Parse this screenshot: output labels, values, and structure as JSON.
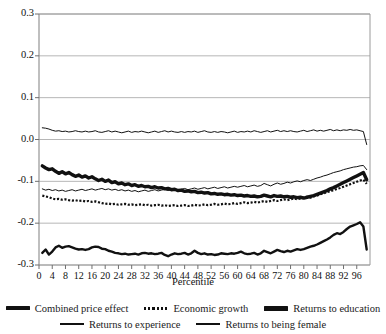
{
  "chart_data": {
    "type": "line",
    "title": "",
    "xlabel": "Percentile",
    "ylabel": "",
    "xlim": [
      0,
      100
    ],
    "ylim": [
      -0.3,
      0.3
    ],
    "yticks": [
      "0.3",
      "0.2",
      "0.1",
      "0.0",
      "-0.1",
      "-0.2",
      "-0.3"
    ],
    "ytick_values": [
      0.3,
      0.2,
      0.1,
      0.0,
      -0.1,
      -0.2,
      -0.3
    ],
    "xticks": [
      "0",
      "4",
      "8",
      "12",
      "16",
      "20",
      "24",
      "28",
      "32",
      "36",
      "40",
      "44",
      "48",
      "52",
      "56",
      "60",
      "64",
      "68",
      "72",
      "76",
      "80",
      "84",
      "88",
      "92",
      "96"
    ],
    "xtick_values": [
      0,
      4,
      8,
      12,
      16,
      20,
      24,
      28,
      32,
      36,
      40,
      44,
      48,
      52,
      56,
      60,
      64,
      68,
      72,
      76,
      80,
      84,
      88,
      92,
      96
    ],
    "grid": "horizontal",
    "legend_position": "bottom",
    "x": [
      1,
      2,
      3,
      4,
      5,
      6,
      7,
      8,
      9,
      10,
      11,
      12,
      13,
      14,
      15,
      16,
      17,
      18,
      19,
      20,
      21,
      22,
      23,
      24,
      25,
      26,
      27,
      28,
      29,
      30,
      31,
      32,
      33,
      34,
      35,
      36,
      37,
      38,
      39,
      40,
      41,
      42,
      43,
      44,
      45,
      46,
      47,
      48,
      49,
      50,
      51,
      52,
      53,
      54,
      55,
      56,
      57,
      58,
      59,
      60,
      61,
      62,
      63,
      64,
      65,
      66,
      67,
      68,
      69,
      70,
      71,
      72,
      73,
      74,
      75,
      76,
      77,
      78,
      79,
      80,
      81,
      82,
      83,
      84,
      85,
      86,
      87,
      88,
      89,
      90,
      91,
      92,
      93,
      94,
      95,
      96,
      97,
      98,
      99
    ],
    "series": [
      {
        "name": "Combined price effect",
        "style": "solid-thick",
        "color": "#111111",
        "values": [
          -0.271,
          -0.263,
          -0.275,
          -0.268,
          -0.258,
          -0.254,
          -0.259,
          -0.256,
          -0.255,
          -0.258,
          -0.261,
          -0.263,
          -0.262,
          -0.264,
          -0.262,
          -0.258,
          -0.256,
          -0.257,
          -0.261,
          -0.262,
          -0.266,
          -0.268,
          -0.271,
          -0.272,
          -0.274,
          -0.273,
          -0.275,
          -0.274,
          -0.273,
          -0.275,
          -0.272,
          -0.271,
          -0.273,
          -0.272,
          -0.274,
          -0.273,
          -0.271,
          -0.276,
          -0.279,
          -0.275,
          -0.272,
          -0.274,
          -0.273,
          -0.271,
          -0.275,
          -0.272,
          -0.266,
          -0.271,
          -0.274,
          -0.272,
          -0.275,
          -0.274,
          -0.276,
          -0.275,
          -0.272,
          -0.273,
          -0.274,
          -0.272,
          -0.273,
          -0.271,
          -0.268,
          -0.272,
          -0.274,
          -0.273,
          -0.271,
          -0.275,
          -0.272,
          -0.266,
          -0.269,
          -0.272,
          -0.268,
          -0.264,
          -0.267,
          -0.269,
          -0.266,
          -0.268,
          -0.265,
          -0.262,
          -0.264,
          -0.262,
          -0.259,
          -0.256,
          -0.254,
          -0.251,
          -0.247,
          -0.243,
          -0.239,
          -0.234,
          -0.228,
          -0.224,
          -0.226,
          -0.221,
          -0.214,
          -0.208,
          -0.205,
          -0.202,
          -0.198,
          -0.208,
          -0.263
        ]
      },
      {
        "name": "Economic growth",
        "style": "dotted",
        "color": "#111111",
        "values": [
          -0.134,
          -0.136,
          -0.138,
          -0.141,
          -0.143,
          -0.142,
          -0.144,
          -0.143,
          -0.145,
          -0.146,
          -0.145,
          -0.147,
          -0.146,
          -0.148,
          -0.147,
          -0.149,
          -0.148,
          -0.15,
          -0.152,
          -0.154,
          -0.153,
          -0.155,
          -0.154,
          -0.156,
          -0.155,
          -0.154,
          -0.156,
          -0.155,
          -0.157,
          -0.156,
          -0.155,
          -0.157,
          -0.156,
          -0.158,
          -0.157,
          -0.156,
          -0.158,
          -0.157,
          -0.159,
          -0.158,
          -0.157,
          -0.159,
          -0.158,
          -0.157,
          -0.159,
          -0.158,
          -0.156,
          -0.158,
          -0.157,
          -0.155,
          -0.157,
          -0.156,
          -0.154,
          -0.156,
          -0.155,
          -0.153,
          -0.155,
          -0.154,
          -0.152,
          -0.154,
          -0.152,
          -0.15,
          -0.152,
          -0.151,
          -0.149,
          -0.151,
          -0.149,
          -0.147,
          -0.149,
          -0.147,
          -0.145,
          -0.147,
          -0.145,
          -0.143,
          -0.145,
          -0.143,
          -0.141,
          -0.143,
          -0.141,
          -0.139,
          -0.137,
          -0.139,
          -0.136,
          -0.134,
          -0.131,
          -0.129,
          -0.126,
          -0.124,
          -0.121,
          -0.118,
          -0.116,
          -0.113,
          -0.11,
          -0.107,
          -0.104,
          -0.101,
          -0.098,
          -0.096,
          -0.106
        ]
      },
      {
        "name": "Returns to education",
        "style": "solid-thickest",
        "color": "#111111",
        "values": [
          -0.063,
          -0.068,
          -0.072,
          -0.07,
          -0.076,
          -0.081,
          -0.077,
          -0.082,
          -0.079,
          -0.084,
          -0.088,
          -0.085,
          -0.09,
          -0.087,
          -0.092,
          -0.089,
          -0.094,
          -0.098,
          -0.095,
          -0.1,
          -0.097,
          -0.103,
          -0.101,
          -0.106,
          -0.104,
          -0.108,
          -0.106,
          -0.11,
          -0.108,
          -0.112,
          -0.11,
          -0.113,
          -0.112,
          -0.115,
          -0.113,
          -0.116,
          -0.115,
          -0.118,
          -0.117,
          -0.12,
          -0.119,
          -0.122,
          -0.121,
          -0.124,
          -0.123,
          -0.125,
          -0.124,
          -0.127,
          -0.126,
          -0.128,
          -0.127,
          -0.13,
          -0.129,
          -0.131,
          -0.13,
          -0.132,
          -0.131,
          -0.133,
          -0.132,
          -0.134,
          -0.133,
          -0.135,
          -0.134,
          -0.136,
          -0.135,
          -0.137,
          -0.136,
          -0.133,
          -0.135,
          -0.137,
          -0.134,
          -0.136,
          -0.135,
          -0.137,
          -0.136,
          -0.138,
          -0.137,
          -0.139,
          -0.138,
          -0.14,
          -0.138,
          -0.136,
          -0.134,
          -0.131,
          -0.128,
          -0.125,
          -0.122,
          -0.118,
          -0.115,
          -0.111,
          -0.107,
          -0.103,
          -0.099,
          -0.095,
          -0.091,
          -0.087,
          -0.083,
          -0.079,
          -0.096
        ]
      },
      {
        "name": "Returns to experience",
        "style": "solid-thin",
        "color": "#111111",
        "values": [
          -0.118,
          -0.121,
          -0.119,
          -0.122,
          -0.12,
          -0.123,
          -0.121,
          -0.124,
          -0.122,
          -0.12,
          -0.123,
          -0.121,
          -0.119,
          -0.122,
          -0.12,
          -0.118,
          -0.121,
          -0.119,
          -0.117,
          -0.12,
          -0.118,
          -0.121,
          -0.119,
          -0.122,
          -0.12,
          -0.123,
          -0.121,
          -0.124,
          -0.122,
          -0.125,
          -0.123,
          -0.121,
          -0.124,
          -0.122,
          -0.12,
          -0.123,
          -0.121,
          -0.119,
          -0.122,
          -0.12,
          -0.118,
          -0.121,
          -0.119,
          -0.117,
          -0.12,
          -0.118,
          -0.116,
          -0.119,
          -0.117,
          -0.115,
          -0.118,
          -0.116,
          -0.114,
          -0.117,
          -0.115,
          -0.113,
          -0.116,
          -0.114,
          -0.112,
          -0.114,
          -0.112,
          -0.11,
          -0.113,
          -0.111,
          -0.109,
          -0.112,
          -0.11,
          -0.105,
          -0.108,
          -0.111,
          -0.107,
          -0.104,
          -0.107,
          -0.105,
          -0.102,
          -0.104,
          -0.101,
          -0.099,
          -0.101,
          -0.098,
          -0.096,
          -0.098,
          -0.095,
          -0.092,
          -0.09,
          -0.087,
          -0.085,
          -0.082,
          -0.079,
          -0.077,
          -0.075,
          -0.072,
          -0.07,
          -0.068,
          -0.066,
          -0.065,
          -0.063,
          -0.062,
          -0.072
        ]
      },
      {
        "name": "Returns to being female",
        "style": "solid-thin",
        "color": "#111111",
        "values": [
          0.028,
          0.027,
          0.025,
          0.022,
          0.02,
          0.021,
          0.019,
          0.02,
          0.018,
          0.019,
          0.021,
          0.019,
          0.018,
          0.02,
          0.018,
          0.019,
          0.021,
          0.018,
          0.017,
          0.019,
          0.021,
          0.018,
          0.02,
          0.018,
          0.016,
          0.018,
          0.02,
          0.017,
          0.019,
          0.018,
          0.02,
          0.018,
          0.016,
          0.018,
          0.02,
          0.017,
          0.019,
          0.021,
          0.018,
          0.02,
          0.018,
          0.017,
          0.019,
          0.017,
          0.019,
          0.018,
          0.02,
          0.017,
          0.019,
          0.021,
          0.018,
          0.017,
          0.019,
          0.017,
          0.019,
          0.018,
          0.016,
          0.018,
          0.02,
          0.017,
          0.019,
          0.018,
          0.02,
          0.018,
          0.021,
          0.019,
          0.017,
          0.019,
          0.021,
          0.018,
          0.02,
          0.022,
          0.019,
          0.021,
          0.019,
          0.021,
          0.019,
          0.018,
          0.02,
          0.022,
          0.019,
          0.021,
          0.023,
          0.02,
          0.022,
          0.02,
          0.022,
          0.024,
          0.021,
          0.023,
          0.021,
          0.023,
          0.022,
          0.024,
          0.022,
          0.023,
          0.021,
          0.019,
          -0.012
        ]
      }
    ]
  },
  "legend": {
    "rows": [
      [
        {
          "label": "Combined price effect",
          "key": "thick"
        },
        {
          "label": "Economic growth",
          "key": "dotted"
        },
        {
          "label": "Returns to education",
          "key": "thicker"
        }
      ],
      [
        {
          "label": "Returns to experience",
          "key": "thin"
        },
        {
          "label": "Returns to being female",
          "key": "thin"
        }
      ]
    ]
  },
  "colors": {
    "ink": "#111111",
    "grid": "#b6b6b6",
    "frame": "#9a9a9a",
    "background": "#ffffff"
  }
}
